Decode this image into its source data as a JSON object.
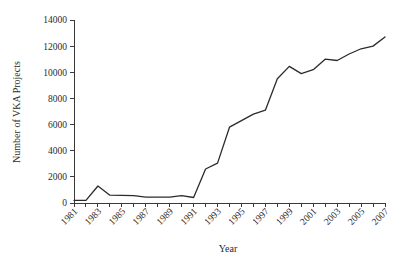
{
  "chart_data": {
    "type": "line",
    "title": "",
    "xlabel": "Year",
    "ylabel": "Number of VKA Projects",
    "xlim": [
      1981,
      2007
    ],
    "ylim": [
      0,
      14000
    ],
    "ytick_step": 2000,
    "grid": false,
    "legend": false,
    "line_color": "#2b2b2b",
    "axis_color": "#3a3a3a",
    "x": [
      1981,
      1982,
      1983,
      1984,
      1985,
      1986,
      1987,
      1988,
      1989,
      1990,
      1991,
      1992,
      1993,
      1994,
      1995,
      1996,
      1997,
      1998,
      1999,
      2000,
      2001,
      2002,
      2003,
      2004,
      2005,
      2006,
      2007
    ],
    "values": [
      200,
      200,
      1300,
      600,
      580,
      560,
      450,
      450,
      450,
      560,
      420,
      2600,
      3050,
      5800,
      6300,
      6800,
      7100,
      9500,
      10450,
      9900,
      10200,
      11000,
      10900,
      11400,
      11800,
      12000,
      12700
    ],
    "xtick_labels": [
      "1981",
      "1983",
      "1985",
      "1987",
      "1989",
      "1991",
      "1993",
      "1995",
      "1997",
      "1999",
      "2001",
      "2003",
      "2005",
      "2007"
    ],
    "xtick_values": [
      1981,
      1983,
      1985,
      1987,
      1989,
      1991,
      1993,
      1995,
      1997,
      1999,
      2001,
      2003,
      2005,
      2007
    ],
    "ytick_labels": [
      "0",
      "2000",
      "4000",
      "6000",
      "8000",
      "10000",
      "12000",
      "14000"
    ],
    "ytick_values": [
      0,
      2000,
      4000,
      6000,
      8000,
      10000,
      12000,
      14000
    ]
  }
}
